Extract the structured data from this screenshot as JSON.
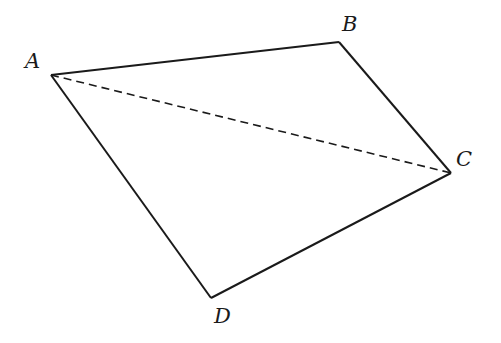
{
  "diagram": {
    "type": "quadrilateral",
    "colors": {
      "stroke": "#1a1a1a",
      "background": "#ffffff"
    },
    "vertices": {
      "A": {
        "label": "A",
        "x": 51,
        "y": 75,
        "label_x": 25,
        "label_y": 68
      },
      "B": {
        "label": "B",
        "x": 339,
        "y": 42,
        "label_x": 342,
        "label_y": 31
      },
      "C": {
        "label": "C",
        "x": 451,
        "y": 173,
        "label_x": 456,
        "label_y": 166
      },
      "D": {
        "label": "D",
        "x": 211,
        "y": 298,
        "label_x": 214,
        "label_y": 323
      }
    },
    "edges": [
      {
        "from": "A",
        "to": "B",
        "style": "solid"
      },
      {
        "from": "B",
        "to": "C",
        "style": "solid"
      },
      {
        "from": "C",
        "to": "D",
        "style": "solid"
      },
      {
        "from": "D",
        "to": "A",
        "style": "solid"
      },
      {
        "from": "A",
        "to": "C",
        "style": "dashed"
      }
    ]
  }
}
